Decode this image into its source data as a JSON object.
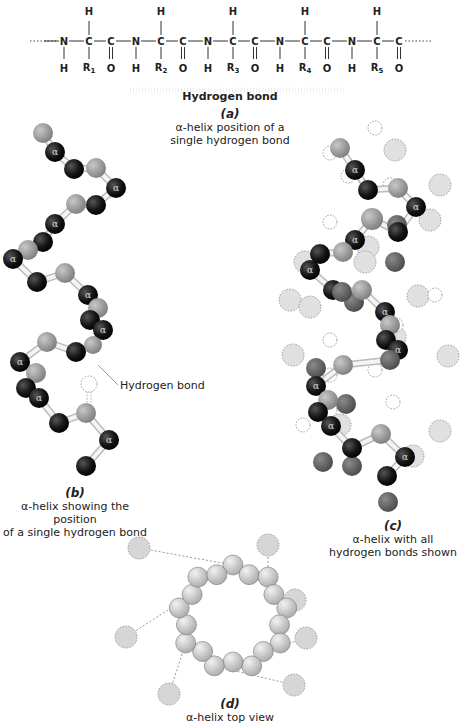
{
  "chain": {
    "residues": [
      {
        "n": "N",
        "nh": "H",
        "ca": "C",
        "ca_h": "H",
        "r": "R",
        "r_sub": "1",
        "c": "C",
        "o": "O"
      },
      {
        "n": "N",
        "nh": "H",
        "ca": "C",
        "ca_h": "H",
        "r": "R",
        "r_sub": "2",
        "c": "C",
        "o": "O"
      },
      {
        "n": "N",
        "nh": "H",
        "ca": "C",
        "ca_h": "H",
        "r": "R",
        "r_sub": "3",
        "c": "C",
        "o": "O"
      },
      {
        "n": "N",
        "nh": "H",
        "ca": "C",
        "ca_h": "H",
        "r": "R",
        "r_sub": "4",
        "c": "C",
        "o": "O"
      },
      {
        "n": "N",
        "nh": "H",
        "ca": "C",
        "ca_h": "H",
        "r": "R",
        "r_sub": "5",
        "c": "C",
        "o": "O"
      }
    ],
    "hbond_label": "Hydrogen bond"
  },
  "panels": {
    "a": {
      "letter": "(a)",
      "line1": "α-helix position of a",
      "line2": "single hydrogen bond"
    },
    "b": {
      "letter": "(b)",
      "line1": "α-helix showing the position",
      "line2": "of a single hydrogen bond",
      "hbond_label": "Hydrogen bond"
    },
    "c": {
      "letter": "(c)",
      "line1": "α-helix with all",
      "line2": "hydrogen bonds shown"
    },
    "d": {
      "letter": "(d)",
      "line1": "α-helix top view"
    }
  },
  "alpha_symbol": "α",
  "colors": {
    "alpha_carbon": "#111111",
    "carbonyl": "#9a9a9a",
    "nitrogen": "#6f6f6f",
    "hydrogen": "#d4d4d4",
    "bond": "#e8e8e8",
    "topview": "#c9c9c9"
  }
}
